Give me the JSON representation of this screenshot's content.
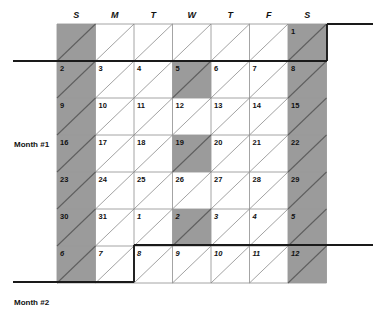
{
  "diagram": {
    "day_headers": [
      "S",
      "M",
      "T",
      "W",
      "T",
      "F",
      "S"
    ],
    "month_labels": {
      "first": "Month #1",
      "second": "Month #2"
    },
    "colors": {
      "shaded_cell": "#9b9b9b",
      "empty_cell": "#ffffff",
      "grid_line": "#9a9a9a",
      "diagonal_line": "#8a8a8a",
      "heavy_line": "#1a1a1a",
      "text": "#111111"
    },
    "geometry": {
      "grid_left": 57,
      "grid_top": 24,
      "cell_width": 38.5,
      "cell_height": 37,
      "columns": 7,
      "rows": 7,
      "rule_left_x": 13,
      "rule_right_x": 373
    },
    "rows": [
      {
        "index": 0,
        "cells": [
          {
            "label": "",
            "shaded": true,
            "month": 1
          },
          {
            "label": "",
            "shaded": false,
            "month": 1
          },
          {
            "label": "",
            "shaded": false,
            "month": 1
          },
          {
            "label": "",
            "shaded": false,
            "month": 1
          },
          {
            "label": "",
            "shaded": false,
            "month": 1
          },
          {
            "label": "",
            "shaded": false,
            "month": 1
          },
          {
            "label": "1",
            "shaded": true,
            "month": 1
          }
        ]
      },
      {
        "index": 1,
        "cells": [
          {
            "label": "2",
            "shaded": true,
            "month": 1
          },
          {
            "label": "3",
            "shaded": false,
            "month": 1
          },
          {
            "label": "4",
            "shaded": false,
            "month": 1
          },
          {
            "label": "5",
            "shaded": true,
            "month": 1
          },
          {
            "label": "6",
            "shaded": false,
            "month": 1
          },
          {
            "label": "7",
            "shaded": false,
            "month": 1
          },
          {
            "label": "8",
            "shaded": true,
            "month": 1
          }
        ]
      },
      {
        "index": 2,
        "cells": [
          {
            "label": "9",
            "shaded": true,
            "month": 1
          },
          {
            "label": "10",
            "shaded": false,
            "month": 1
          },
          {
            "label": "11",
            "shaded": false,
            "month": 1
          },
          {
            "label": "12",
            "shaded": false,
            "month": 1
          },
          {
            "label": "13",
            "shaded": false,
            "month": 1
          },
          {
            "label": "14",
            "shaded": false,
            "month": 1
          },
          {
            "label": "15",
            "shaded": true,
            "month": 1
          }
        ]
      },
      {
        "index": 3,
        "cells": [
          {
            "label": "16",
            "shaded": true,
            "month": 1
          },
          {
            "label": "17",
            "shaded": false,
            "month": 1
          },
          {
            "label": "18",
            "shaded": false,
            "month": 1
          },
          {
            "label": "19",
            "shaded": true,
            "month": 1
          },
          {
            "label": "20",
            "shaded": false,
            "month": 1
          },
          {
            "label": "21",
            "shaded": false,
            "month": 1
          },
          {
            "label": "22",
            "shaded": true,
            "month": 1
          }
        ]
      },
      {
        "index": 4,
        "cells": [
          {
            "label": "23",
            "shaded": true,
            "month": 1
          },
          {
            "label": "24",
            "shaded": false,
            "month": 1
          },
          {
            "label": "25",
            "shaded": false,
            "month": 1
          },
          {
            "label": "26",
            "shaded": false,
            "month": 1
          },
          {
            "label": "27",
            "shaded": false,
            "month": 1
          },
          {
            "label": "28",
            "shaded": false,
            "month": 1
          },
          {
            "label": "29",
            "shaded": true,
            "month": 1
          }
        ]
      },
      {
        "index": 5,
        "cells": [
          {
            "label": "30",
            "shaded": true,
            "month": 1
          },
          {
            "label": "31",
            "shaded": false,
            "month": 1
          },
          {
            "label": "1",
            "shaded": false,
            "month": 2
          },
          {
            "label": "2",
            "shaded": true,
            "month": 2
          },
          {
            "label": "3",
            "shaded": false,
            "month": 2
          },
          {
            "label": "4",
            "shaded": false,
            "month": 2
          },
          {
            "label": "5",
            "shaded": true,
            "month": 2
          }
        ]
      },
      {
        "index": 6,
        "cells": [
          {
            "label": "6",
            "shaded": true,
            "month": 2
          },
          {
            "label": "7",
            "shaded": false,
            "month": 2
          },
          {
            "label": "8",
            "shaded": false,
            "month": 2
          },
          {
            "label": "9",
            "shaded": false,
            "month": 2
          },
          {
            "label": "10",
            "shaded": false,
            "month": 2
          },
          {
            "label": "11",
            "shaded": false,
            "month": 2
          },
          {
            "label": "12",
            "shaded": true,
            "month": 2
          }
        ]
      }
    ],
    "heavy_rules": [
      {
        "name": "month1-start-top",
        "x1": 327,
        "y1": 24,
        "x2": 373,
        "y2": 24
      },
      {
        "name": "month1-start-left",
        "x1": 327,
        "y1": 24,
        "x2": 327,
        "y2": 61
      },
      {
        "name": "month1-start-bottom",
        "x1": 13,
        "y1": 61,
        "x2": 327,
        "y2": 61
      },
      {
        "name": "month2-start-top",
        "x1": 134,
        "y1": 245,
        "x2": 373,
        "y2": 245
      },
      {
        "name": "month2-start-left",
        "x1": 134,
        "y1": 245,
        "x2": 134,
        "y2": 282
      },
      {
        "name": "month2-start-bottom",
        "x1": 13,
        "y1": 282,
        "x2": 134,
        "y2": 282
      }
    ]
  }
}
